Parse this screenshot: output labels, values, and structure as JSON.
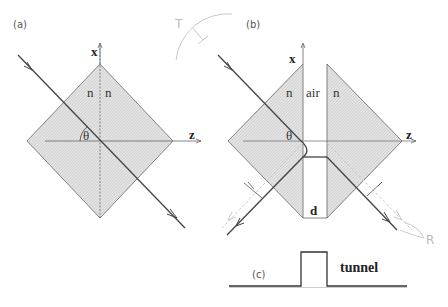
{
  "panels": {
    "a": {
      "label": "(a)",
      "axis_x": "x",
      "axis_z": "z",
      "index_left": "n",
      "index_right": "n",
      "angle": "θ"
    },
    "b": {
      "label": "(b)",
      "axis_x": "x",
      "axis_z": "z",
      "index_left": "n",
      "gap_medium": "air",
      "index_right": "n",
      "angle": "θ",
      "gap_width": "d",
      "transmitted_label": "T",
      "reflected_label": "R"
    },
    "c": {
      "label": "(c)",
      "caption": "tunnel"
    }
  },
  "colors": {
    "prism_fill": "#dcdcdc",
    "line": "#444444",
    "faint": "#c8c8c8"
  }
}
